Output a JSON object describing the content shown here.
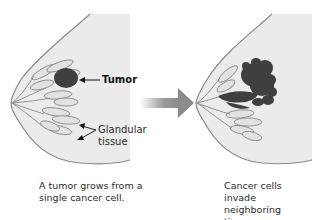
{
  "figure": {
    "left_panel": {
      "labels": {
        "tumor": "Tumor",
        "glandular_tissue": "Glandular\ntissue"
      },
      "caption": "A tumor grows from a\nsingle cancer cell."
    },
    "right_panel": {
      "caption": "Cancer cells invade\nneighboring tissue."
    },
    "colors": {
      "breast_fill": "#ebebeb",
      "outline": "#8a8a8a",
      "lobule_fill": "#e2e2e2",
      "tumor": "#3f3f3f",
      "arrow": "#8c8c8c"
    }
  }
}
